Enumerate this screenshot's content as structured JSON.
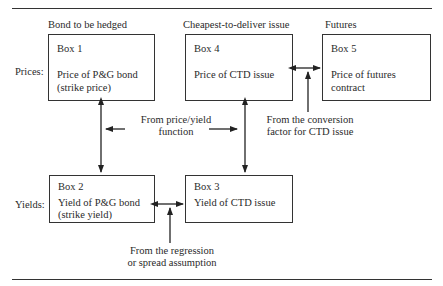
{
  "columns": {
    "hedged": "Bond to be hedged",
    "ctd": "Cheapest-to-deliver issue",
    "futures": "Futures"
  },
  "rows": {
    "prices": "Prices:",
    "yields": "Yields:"
  },
  "boxes": {
    "box1": {
      "title": "Box 1",
      "line1": "Price of P&G bond",
      "line2": "(strike price)"
    },
    "box2": {
      "title": "Box 2",
      "line1": "Yield of P&G bond",
      "line2": "(strike yield)"
    },
    "box3": {
      "title": "Box 3",
      "line1": "Yield of CTD issue"
    },
    "box4": {
      "title": "Box 4",
      "line1": "Price of CTD issue"
    },
    "box5": {
      "title": "Box 5",
      "line1": "Price of futures",
      "line2": "contract"
    }
  },
  "annotations": {
    "price_yield": {
      "line1": "From price/yield",
      "line2": "function"
    },
    "conversion": {
      "line1": "From the conversion",
      "line2": "factor for CTD issue"
    },
    "regression": {
      "line1": "From the regression",
      "line2": "or spread assumption"
    }
  },
  "colors": {
    "line": "#333333",
    "text": "#2a2a2a",
    "background": "#ffffff"
  }
}
